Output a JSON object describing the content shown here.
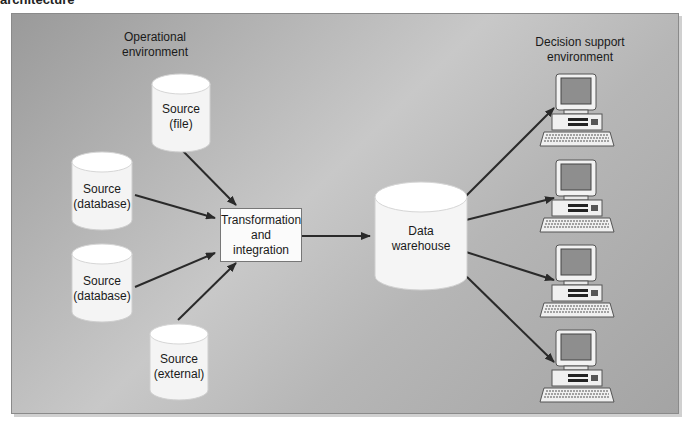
{
  "figure": {
    "caption": "architecture",
    "background_color": "#b5b5b5",
    "arrow_color": "#2a2a2a"
  },
  "operational": {
    "title_line1": "Operational",
    "title_line2": "environment",
    "sources": [
      {
        "line1": "Source",
        "line2": "(file)"
      },
      {
        "line1": "Source",
        "line2": "(database)"
      },
      {
        "line1": "Source",
        "line2": "(database)"
      },
      {
        "line1": "Source",
        "line2": "(external)"
      }
    ]
  },
  "transform": {
    "line1": "Transformation",
    "line2": "and",
    "line3": "integration"
  },
  "warehouse": {
    "line1": "Data",
    "line2": "warehouse"
  },
  "decision_support": {
    "title_line1": "Decision support",
    "title_line2": "environment",
    "workstations": [
      {
        "icon": "desktop-computer-icon"
      },
      {
        "icon": "desktop-computer-icon"
      },
      {
        "icon": "desktop-computer-icon"
      },
      {
        "icon": "desktop-computer-icon"
      }
    ]
  }
}
